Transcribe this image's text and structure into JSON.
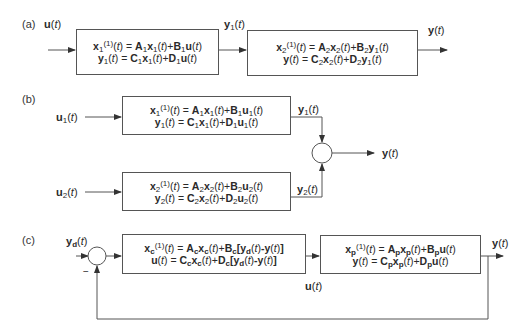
{
  "panels": [
    {
      "tag": "(a)",
      "title": "Series connection",
      "input_label": "u(t)",
      "intermediate_label": "y1(t)",
      "output_label": "y(t)",
      "blocks": [
        {
          "eq1": "x1^(1)(t) = A1x1(t)+B1u(t)",
          "eq2": "y1(t) = C1x1(t)+D1u(t)"
        },
        {
          "eq1": "x2^(1)(t) = A2x2(t)+B2y1(t)",
          "eq2": "y(t) = C2x2(t)+D2y1(t)"
        }
      ]
    },
    {
      "tag": "(b)",
      "title": "Parallel connection",
      "inputs": [
        "u1(t)",
        "u2(t)"
      ],
      "block_outputs": [
        "y1(t)",
        "y2(t)"
      ],
      "output_label": "y(t)",
      "blocks": [
        {
          "eq1": "x1^(1)(t) = A1x1(t)+B1u1(t)",
          "eq2": "y1(t) = C1x1(t)+D1u1(t)"
        },
        {
          "eq1": "x2^(1)(t) = A2x2(t)+B2u2(t)",
          "eq2": "y2(t) = C2x2(t)+D2u2(t)"
        }
      ]
    },
    {
      "tag": "(c)",
      "title": "Feedback connection",
      "reference_label": "yd(t)",
      "minus_sign": "−",
      "control_label": "u(t)",
      "output_label": "y(t)",
      "blocks": [
        {
          "eq1": "xc^(1)(t) = Acxc(t)+Bc[yd(t)-y(t)]",
          "eq2": "u(t) = Ccxc(t)+Dc[yd(t)-y(t)]"
        },
        {
          "eq1": "xp^(1)(t) = Apxp(t)+Bpu(t)",
          "eq2": "y(t) = Cpxp(t)+Dpu(t)"
        }
      ]
    }
  ]
}
